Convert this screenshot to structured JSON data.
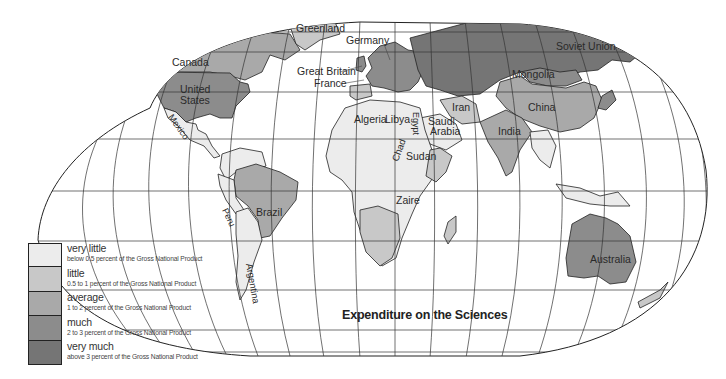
{
  "map": {
    "title": "Expenditure on the Sciences",
    "colors": {
      "very_little": "#ececec",
      "little": "#c8c8c8",
      "average": "#a9a9a9",
      "much": "#8c8c8c",
      "very_much": "#757575",
      "ocean": "#ffffff",
      "grid": "#333333"
    },
    "legend": [
      {
        "key": "very_little",
        "title": "very little",
        "desc": "below 0.5 percent of the Gross National Product",
        "color": "#ececec"
      },
      {
        "key": "little",
        "title": "little",
        "desc": "0.5 to 1 percent of the Gross National Product",
        "color": "#c8c8c8"
      },
      {
        "key": "average",
        "title": "average",
        "desc": "1 to 2 percent of the Gross National Product",
        "color": "#a9a9a9"
      },
      {
        "key": "much",
        "title": "much",
        "desc": "2 to 3 percent of the Gross National Product",
        "color": "#8c8c8c"
      },
      {
        "key": "very_much",
        "title": "very much",
        "desc": "above 3 percent of the Gross National Product",
        "color": "#757575"
      }
    ],
    "labels": {
      "canada": "Canada",
      "united": "United",
      "states": "States",
      "mexico": "Mexico",
      "greenland": "Greenland",
      "germany": "Germany",
      "great_britain": "Great Britain",
      "france": "France",
      "soviet_union": "Soviet Union",
      "mongolia": "Mongolia",
      "china": "China",
      "iran": "Iran",
      "india": "India",
      "algeria": "Algeria",
      "libya": "Libya",
      "egypt": "Egypt",
      "saudi": "Saudi",
      "arabia": "Arabia",
      "chad": "Chad",
      "sudan": "Sudan",
      "zaire": "Zaire",
      "brazil": "Brazil",
      "peru": "Peru",
      "argentina": "Argentina",
      "australia": "Australia"
    },
    "countries": [
      {
        "name": "Canada",
        "category": "average"
      },
      {
        "name": "United States",
        "category": "much"
      },
      {
        "name": "Mexico",
        "category": "very_little"
      },
      {
        "name": "Greenland",
        "category": "little"
      },
      {
        "name": "Germany",
        "category": "much"
      },
      {
        "name": "Great Britain",
        "category": "much"
      },
      {
        "name": "France",
        "category": "much"
      },
      {
        "name": "Soviet Union",
        "category": "very_much"
      },
      {
        "name": "Mongolia",
        "category": "much"
      },
      {
        "name": "China",
        "category": "average"
      },
      {
        "name": "Iran",
        "category": "little"
      },
      {
        "name": "India",
        "category": "average"
      },
      {
        "name": "Algeria",
        "category": "very_little"
      },
      {
        "name": "Libya",
        "category": "very_little"
      },
      {
        "name": "Egypt",
        "category": "very_little"
      },
      {
        "name": "Saudi Arabia",
        "category": "very_little"
      },
      {
        "name": "Chad",
        "category": "very_little"
      },
      {
        "name": "Sudan",
        "category": "very_little"
      },
      {
        "name": "Zaire",
        "category": "very_little"
      },
      {
        "name": "Brazil",
        "category": "average"
      },
      {
        "name": "Peru",
        "category": "very_little"
      },
      {
        "name": "Argentina",
        "category": "very_little"
      },
      {
        "name": "Australia",
        "category": "much"
      }
    ]
  }
}
